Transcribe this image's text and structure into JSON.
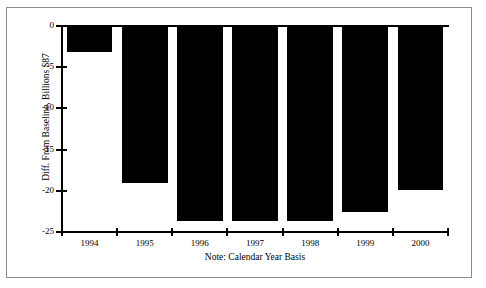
{
  "chart_data": {
    "type": "bar",
    "title": "",
    "subtitle": "",
    "xlabel": "",
    "ylabel": "Diff. From Baseline, Billions $87",
    "note": "Note: Calendar Year Basis",
    "categories": [
      "1994",
      "1995",
      "1996",
      "1997",
      "1998",
      "1999",
      "2000"
    ],
    "values": [
      -3.2,
      -19.0,
      -23.7,
      -23.7,
      -23.7,
      -22.6,
      -19.9
    ],
    "series": [
      {
        "name": "Diff. From Baseline",
        "values": [
          -3.2,
          -19.0,
          -23.7,
          -23.7,
          -23.7,
          -22.6,
          -19.9
        ]
      }
    ],
    "ylim": [
      -25,
      0
    ],
    "yticks": [
      0,
      -5,
      -10,
      -15,
      -20,
      -25
    ],
    "ytick_labels": [
      "0",
      "-5",
      "-10",
      "-15",
      "-20",
      "-25"
    ],
    "xtick_labels": [
      "1994",
      "1995",
      "1996",
      "1997",
      "1998",
      "1999",
      "2000"
    ],
    "grid": false,
    "legend": false,
    "legend_position": "none",
    "bar_color": "#000000",
    "axis_color": "#000000",
    "background_color": "#ffffff",
    "frame_color": "#8a8a8a"
  }
}
